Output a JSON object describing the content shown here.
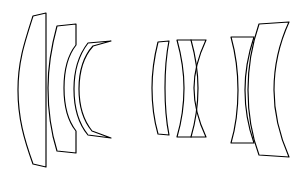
{
  "diagram": {
    "type": "optical-layout",
    "orientation": "horizontal",
    "canvas": {
      "width": 298,
      "height": 177
    },
    "background_color": "#ffffff",
    "stroke_color": "#000000",
    "fill_color": "#ffffff",
    "stroke_width": 1.15,
    "group_count": 3,
    "element_count": 7,
    "groups": [
      {
        "name": "front-group",
        "label": "Front group",
        "element_count": 3,
        "elements": [
          {
            "id": "element-1",
            "name": "front-meniscus",
            "shape": "positive meniscus, convex front, flat rear",
            "x_range": [
              18,
              46
            ],
            "y_range": [
              13,
              167
            ],
            "outline": "M 46,13 L 33,16 C 24,44 18,62 18,90 C 18,118 24,139 33,164 L 46,167 Z"
          },
          {
            "id": "element-2",
            "name": "meniscus-deep-concave-rear",
            "shape": "meniscus, convex front, deep concave rear",
            "x_range": [
              48,
              76
            ],
            "y_range": [
              24,
              153
            ],
            "outline": "M 76,24 L 57,26 C 51,48 48,68 48,88 C 48,110 51,132 57,151 L 76,153 L 76,131 C 68,121 64,105 64,88 C 64,71 68,55 76,45 Z"
          },
          {
            "id": "element-3",
            "name": "deep-meniscus-crescent",
            "shape": "strong negative meniscus crescent",
            "x_range": [
              64,
              111
            ],
            "y_range": [
              41,
              138
            ],
            "outline": "M 111,41 L 88,43 C 78,56 74,71 74,89 C 74,108 78,123 88,135 L 111,138 L 92,131 C 83,120 79,105 79,89 C 79,72 84,56 93,46 Z"
          }
        ]
      },
      {
        "name": "middle-group",
        "label": "Middle group",
        "element_count": 2,
        "elements": [
          {
            "id": "element-4",
            "name": "middle-meniscus",
            "shape": "positive meniscus, convex front, near-flat rear",
            "x_range": [
              152,
              169
            ],
            "y_range": [
              41,
              135
            ],
            "outline": "M 169,41 L 158,42 C 154,58 152,72 152,88 C 152,105 154,120 158,134 L 169,135 C 166,120 165,104 165,88 C 165,72 166,56 169,41 Z"
          },
          {
            "id": "element-5",
            "name": "cemented-doublet-middle",
            "shape": "cemented doublet: concave-front element plus biconvex element",
            "x_range": [
              177,
              206
            ],
            "y_range": [
              40,
              137
            ],
            "outline": "M 206,40 L 177,40 C 182,58 184,73 184,88 C 184,104 182,120 177,137 L 206,137 C 198,120 194,104 194,88 C 194,72 198,57 206,40 Z",
            "seam": "M 191,40 C 196,58 198,73 198,88 C 198,104 196,120 191,137"
          }
        ]
      },
      {
        "name": "rear-group",
        "label": "Rear group",
        "element_count": 2,
        "elements": [
          {
            "id": "element-6",
            "name": "rear-thin-meniscus",
            "shape": "thin meniscus, concave rear",
            "x_range": [
              231,
              254
            ],
            "y_range": [
              37,
              143
            ],
            "outline": "M 254,37 L 231,37 C 236,55 238,72 238,90 C 238,108 236,126 231,143 L 254,143 C 248,126 245,108 245,90 C 245,72 248,55 254,37 Z"
          },
          {
            "id": "element-7",
            "name": "rear-biconvex",
            "shape": "large biconvex lens",
            "x_range": [
              248,
              289
            ],
            "y_range": [
              22,
              157
            ],
            "outline": "M 289,22 L 259,24 C 250,50 248,70 248,90 C 248,112 251,134 259,155 L 289,157 C 278,132 274,111 274,90 C 274,68 278,46 289,22 Z"
          }
        ]
      }
    ]
  }
}
